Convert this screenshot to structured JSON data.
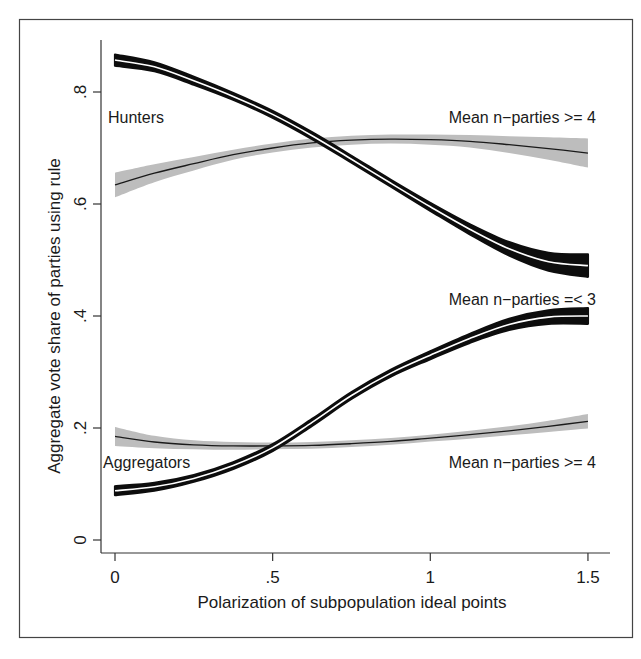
{
  "chart_data": {
    "type": "line",
    "title": "",
    "xlabel": "Polarization of subpopulation ideal points",
    "ylabel": "Aggregate vote share of parties using rule",
    "xlim": [
      0,
      1.5
    ],
    "ylim": [
      0,
      0.88
    ],
    "x_ticks": [
      {
        "value": 0,
        "label": "0"
      },
      {
        "value": 0.5,
        "label": ".5"
      },
      {
        "value": 1,
        "label": "1"
      },
      {
        "value": 1.5,
        "label": "1.5"
      }
    ],
    "y_ticks": [
      {
        "value": 0,
        "label": "0"
      },
      {
        "value": 0.2,
        "label": ".2"
      },
      {
        "value": 0.4,
        "label": ".4"
      },
      {
        "value": 0.6,
        "label": ".6"
      },
      {
        "value": 0.8,
        "label": ".8"
      }
    ],
    "grid": false,
    "legend": "none (inline annotations)",
    "x": [
      0,
      0.125,
      0.25,
      0.375,
      0.5,
      0.625,
      0.75,
      0.875,
      1.0,
      1.125,
      1.25,
      1.375,
      1.5
    ],
    "series": [
      {
        "name": "Hunters, Mean n-parties =< 3",
        "style": "black band with white center line",
        "values": [
          0.857,
          0.845,
          0.82,
          0.792,
          0.76,
          0.722,
          0.68,
          0.637,
          0.595,
          0.555,
          0.52,
          0.497,
          0.49
        ],
        "ci_halfwidth": [
          0.01,
          0.008,
          0.007,
          0.006,
          0.006,
          0.006,
          0.006,
          0.006,
          0.007,
          0.009,
          0.012,
          0.016,
          0.02
        ]
      },
      {
        "name": "Aggregators, Mean n-parties =< 3",
        "style": "black band with white center line",
        "values": [
          0.088,
          0.095,
          0.11,
          0.133,
          0.165,
          0.21,
          0.258,
          0.298,
          0.33,
          0.36,
          0.385,
          0.398,
          0.4
        ],
        "ci_halfwidth": [
          0.008,
          0.007,
          0.006,
          0.006,
          0.006,
          0.006,
          0.006,
          0.006,
          0.007,
          0.008,
          0.01,
          0.012,
          0.014
        ]
      },
      {
        "name": "Hunters, Mean n-parties >= 4",
        "style": "gray band with thin black center line",
        "values": [
          0.634,
          0.655,
          0.672,
          0.688,
          0.7,
          0.709,
          0.714,
          0.716,
          0.715,
          0.712,
          0.706,
          0.699,
          0.691
        ],
        "ci_halfwidth": [
          0.022,
          0.016,
          0.012,
          0.009,
          0.008,
          0.008,
          0.008,
          0.008,
          0.009,
          0.011,
          0.015,
          0.02,
          0.026
        ]
      },
      {
        "name": "Aggregators, Mean n-parties >= 4",
        "style": "gray band with thin black center line",
        "values": [
          0.185,
          0.175,
          0.17,
          0.168,
          0.168,
          0.169,
          0.172,
          0.176,
          0.182,
          0.188,
          0.195,
          0.203,
          0.212
        ],
        "ci_halfwidth": [
          0.017,
          0.011,
          0.008,
          0.007,
          0.006,
          0.006,
          0.006,
          0.006,
          0.006,
          0.007,
          0.008,
          0.01,
          0.013
        ]
      }
    ],
    "annotations": [
      {
        "text": "Hunters",
        "x": 0.0,
        "y": 0.755
      },
      {
        "text": "Mean n−parties >= 4",
        "x": 1.5,
        "y": 0.755,
        "anchor": "end"
      },
      {
        "text": "Mean n−parties =< 3",
        "x": 1.5,
        "y": 0.43,
        "anchor": "end"
      },
      {
        "text": "Aggregators",
        "x": 0.0,
        "y": 0.14
      },
      {
        "text": "Mean n−parties >= 4",
        "x": 1.5,
        "y": 0.14,
        "anchor": "end"
      }
    ],
    "colors": {
      "dark_band": "#0d0d0d",
      "center_white": "#ffffff",
      "light_band": "#bdbdbd",
      "thin_line": "#1a1a1a",
      "axis": "#333333",
      "frame": "#444444"
    }
  }
}
